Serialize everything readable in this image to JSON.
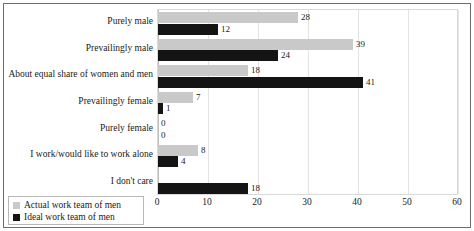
{
  "chart_data": {
    "type": "bar",
    "orientation": "horizontal",
    "title": "",
    "xlabel": "",
    "ylabel": "",
    "xlim": [
      0,
      60
    ],
    "xticks": [
      0,
      10,
      20,
      30,
      40,
      50,
      60
    ],
    "grid": true,
    "legend_position": "bottom-left",
    "categories": [
      "Purely male",
      "Prevailingly male",
      "About equal share of women and men",
      "Prevailingly female",
      "Purely female",
      "I work/would like to work alone",
      "I don't care"
    ],
    "series": [
      {
        "name": "Actual work team of men",
        "color": "#c9c9c9",
        "values": [
          28,
          39,
          18,
          7,
          0,
          8,
          0
        ]
      },
      {
        "name": "Ideal work team of men",
        "color": "#141414",
        "values": [
          12,
          24,
          41,
          1,
          0,
          4,
          18
        ]
      }
    ],
    "data_labels": {
      "actual": [
        "28",
        "39",
        "18",
        "7",
        "0",
        "8",
        ""
      ],
      "ideal": [
        "12",
        "24",
        "41",
        "1",
        "0",
        "4",
        "18"
      ]
    }
  },
  "legend": {
    "items": [
      {
        "label": "Actual work team of men",
        "color": "#c9c9c9"
      },
      {
        "label": "Ideal work team of men",
        "color": "#141414"
      }
    ]
  },
  "axis": {
    "tick_labels": [
      "0",
      "10",
      "20",
      "30",
      "40",
      "50",
      "60"
    ]
  }
}
